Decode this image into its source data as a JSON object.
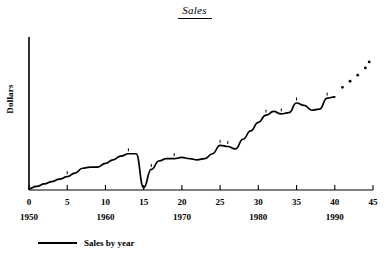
{
  "chart_data": {
    "type": "line",
    "title": "Sales",
    "xlabel": "",
    "ylabel": "Dollars",
    "x": [
      0,
      1,
      2,
      3,
      4,
      5,
      6,
      7,
      8,
      9,
      10,
      11,
      12,
      13,
      14,
      15,
      16,
      17,
      18,
      19,
      20,
      21,
      22,
      23,
      24,
      25,
      26,
      27,
      28,
      29,
      30,
      31,
      32,
      33,
      34,
      35,
      36,
      37,
      38,
      39,
      40
    ],
    "values": [
      1,
      3,
      5,
      7,
      9,
      11,
      14,
      18,
      19,
      19,
      22,
      25,
      28,
      30,
      30,
      2,
      17,
      24,
      26,
      26,
      27,
      26,
      25,
      26,
      30,
      37,
      36,
      34,
      42,
      49,
      56,
      62,
      65,
      63,
      64,
      72,
      70,
      66,
      67,
      76,
      77
    ],
    "series": [
      {
        "name": "Sales by year",
        "values": [
          1,
          3,
          5,
          7,
          9,
          11,
          14,
          18,
          19,
          19,
          22,
          25,
          28,
          30,
          30,
          2,
          17,
          24,
          26,
          26,
          27,
          26,
          25,
          26,
          30,
          37,
          36,
          34,
          42,
          49,
          56,
          62,
          65,
          63,
          64,
          72,
          70,
          66,
          67,
          76,
          77
        ]
      }
    ],
    "forecast_points": {
      "x": [
        41,
        42,
        43,
        44,
        44.5
      ],
      "values": [
        85,
        90,
        95,
        101,
        106
      ]
    },
    "x_tick_labels": [
      "0",
      "5",
      "10",
      "15",
      "20",
      "25",
      "30",
      "35",
      "40",
      "45"
    ],
    "x_tick_values": [
      0,
      5,
      10,
      15,
      20,
      25,
      30,
      35,
      40,
      45
    ],
    "x_year_labels": [
      "1950",
      "1960",
      "1970",
      "1980",
      "1990"
    ],
    "x_year_values": [
      0,
      10,
      20,
      30,
      40
    ],
    "xlim": [
      0,
      45
    ],
    "ylim": [
      0,
      120
    ],
    "grid": false,
    "legend_position": "bottom-left",
    "legend": [
      "Sales by year"
    ],
    "line_color": "#000000",
    "axis_color": "#000000"
  },
  "legend": {
    "entry_label": "Sales by year"
  }
}
